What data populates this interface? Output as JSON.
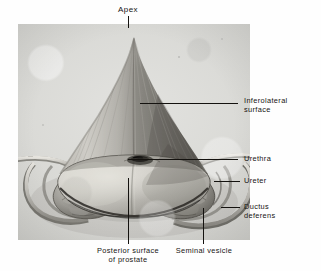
{
  "figure": {
    "title": "Apex",
    "plate": {
      "background_color": "#d6d6d2",
      "border_color": "#c2c2bd"
    }
  },
  "labels": {
    "apex": "Apex",
    "inferolateral_surface": "Inferolateral\nsurface",
    "urethra": "Urethra",
    "ureter": "Ureter",
    "ductus_deferens": "Ductus\ndeferens",
    "posterior_surface_of_prostate": "Posterior surface\nof prostate",
    "seminal_vesicle": "Seminal vesicle"
  },
  "colors": {
    "leader_line": "#14120f",
    "text": "#161412",
    "page_background": "#fefefe",
    "specimen_light": "#cfcec9",
    "specimen_mid": "#9a9892",
    "specimen_dark": "#5d5b55",
    "specimen_shadow": "#2e2c28"
  },
  "leaders": [
    {
      "name": "apex-leader",
      "orientation": "vertical",
      "x": 128,
      "y": 16,
      "length": 12
    },
    {
      "name": "inferolateral-leader",
      "orientation": "horizontal",
      "x": 140,
      "y": 103,
      "length": 98
    },
    {
      "name": "urethra-leader",
      "orientation": "horizontal",
      "x": 128,
      "y": 159,
      "length": 110
    },
    {
      "name": "ureter-leader",
      "orientation": "horizontal",
      "x": 214,
      "y": 181,
      "length": 26
    },
    {
      "name": "ductus-deferens-leader",
      "orientation": "horizontal",
      "x": 221,
      "y": 207,
      "length": 19
    },
    {
      "name": "posterior-surface-leader",
      "orientation": "vertical",
      "x": 128,
      "y": 178,
      "length": 66
    },
    {
      "name": "seminal-vesicle-leader",
      "orientation": "vertical",
      "x": 203,
      "y": 208,
      "length": 36
    }
  ]
}
